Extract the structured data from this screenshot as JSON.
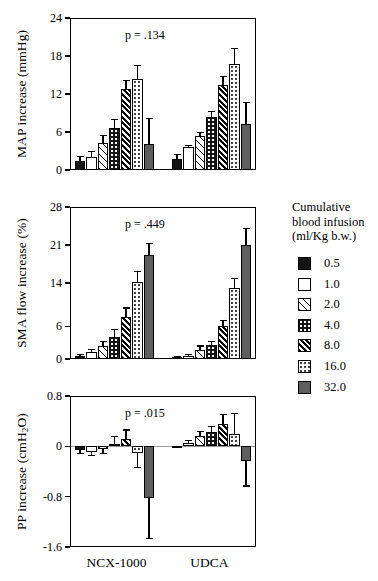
{
  "figure": {
    "x_categories": [
      "NCX-1000",
      "UDCA"
    ],
    "legend": {
      "title_lines": [
        "Cumulative",
        "blood infusion",
        "(ml/Kg b.w.)"
      ],
      "entries": [
        {
          "label": "0.5",
          "pattern": "solid-black"
        },
        {
          "label": "1.0",
          "pattern": "white"
        },
        {
          "label": "2.0",
          "pattern": "light-hatch"
        },
        {
          "label": "4.0",
          "pattern": "black-dotted"
        },
        {
          "label": "8.0",
          "pattern": "dense-hatch"
        },
        {
          "label": "16.0",
          "pattern": "white-dotted"
        },
        {
          "label": "32.0",
          "pattern": "gray-solid"
        }
      ]
    }
  },
  "chart_data": [
    {
      "type": "bar",
      "panel": "top",
      "title": "",
      "annotation": "p = .134",
      "ylabel": "MAP increase (mmHg)",
      "xlabel": "",
      "ylim": [
        0,
        24
      ],
      "yticks": [
        0,
        6,
        12,
        18,
        24
      ],
      "ytick_labels": [
        "0",
        "6",
        "12",
        "18",
        "24"
      ],
      "grid": false,
      "categories": [
        "NCX-1000",
        "UDCA"
      ],
      "series": [
        {
          "name": "0.5",
          "values": [
            1.4,
            1.7
          ],
          "errors": [
            0.7,
            0.7
          ]
        },
        {
          "name": "1.0",
          "values": [
            2.0,
            3.6
          ],
          "errors": [
            0.9,
            0.3
          ]
        },
        {
          "name": "2.0",
          "values": [
            4.3,
            5.3
          ],
          "errors": [
            1.1,
            0.6
          ]
        },
        {
          "name": "4.0",
          "values": [
            6.6,
            8.4
          ],
          "errors": [
            1.4,
            0.8
          ]
        },
        {
          "name": "8.0",
          "values": [
            12.8,
            13.4
          ],
          "errors": [
            1.4,
            1.4
          ]
        },
        {
          "name": "16.0",
          "values": [
            14.3,
            16.8
          ],
          "errors": [
            2.2,
            2.4
          ]
        },
        {
          "name": "32.0",
          "values": [
            4.1,
            7.3
          ],
          "errors": [
            4.0,
            3.3
          ]
        }
      ]
    },
    {
      "type": "bar",
      "panel": "middle",
      "title": "",
      "annotation": "p = .449",
      "ylabel": "SMA flow increase (%)",
      "xlabel": "",
      "ylim": [
        0,
        28
      ],
      "yticks": [
        0,
        6,
        14,
        21,
        28
      ],
      "ytick_labels": [
        "0",
        "6",
        "14",
        "21",
        "28"
      ],
      "grid": false,
      "categories": [
        "NCX-1000",
        "UDCA"
      ],
      "series": [
        {
          "name": "0.5",
          "values": [
            0.6,
            0.3
          ],
          "errors": [
            0.3,
            0.2
          ]
        },
        {
          "name": "1.0",
          "values": [
            1.2,
            0.5
          ],
          "errors": [
            0.6,
            0.3
          ]
        },
        {
          "name": "2.0",
          "values": [
            2.4,
            1.7
          ],
          "errors": [
            0.9,
            0.7
          ]
        },
        {
          "name": "4.0",
          "values": [
            4.1,
            2.6
          ],
          "errors": [
            1.4,
            0.7
          ]
        },
        {
          "name": "8.0",
          "values": [
            7.8,
            6.1
          ],
          "errors": [
            1.6,
            1.0
          ]
        },
        {
          "name": "16.0",
          "values": [
            14.2,
            13.1
          ],
          "errors": [
            1.9,
            1.7
          ]
        },
        {
          "name": "32.0",
          "values": [
            19.1,
            21.0
          ],
          "errors": [
            2.2,
            3.1
          ]
        }
      ]
    },
    {
      "type": "bar",
      "panel": "bottom",
      "title": "",
      "annotation": "p = .015",
      "ylabel": "PP increase (cmH2O)",
      "xlabel": "",
      "ylim": [
        -1.6,
        0.8
      ],
      "yticks": [
        -1.6,
        -0.8,
        0,
        0.8
      ],
      "ytick_labels": [
        "-1.6",
        "-0.8",
        "0",
        "0.8"
      ],
      "grid": false,
      "zero_line": 0,
      "categories": [
        "NCX-1000",
        "UDCA"
      ],
      "series": [
        {
          "name": "0.5",
          "values": [
            -0.06,
            -0.01
          ],
          "errors": [
            0.05,
            0.01
          ]
        },
        {
          "name": "1.0",
          "values": [
            -0.09,
            0.06
          ],
          "errors": [
            0.06,
            0.04
          ]
        },
        {
          "name": "2.0",
          "values": [
            -0.05,
            0.16
          ],
          "errors": [
            0.06,
            0.07
          ]
        },
        {
          "name": "4.0",
          "values": [
            0.04,
            0.22
          ],
          "errors": [
            0.12,
            0.09
          ]
        },
        {
          "name": "8.0",
          "values": [
            0.12,
            0.35
          ],
          "errors": [
            0.14,
            0.16
          ]
        },
        {
          "name": "16.0",
          "values": [
            -0.11,
            0.2
          ],
          "errors": [
            0.22,
            0.32
          ]
        },
        {
          "name": "32.0",
          "values": [
            -0.82,
            -0.23
          ],
          "errors": [
            0.65,
            0.4
          ]
        }
      ]
    }
  ]
}
